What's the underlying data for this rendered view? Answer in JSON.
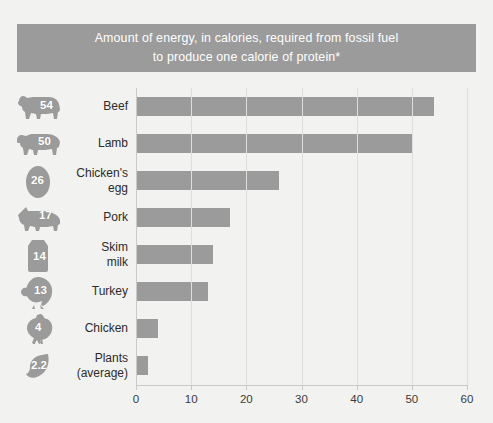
{
  "banner": {
    "line1": "Amount of energy, in calories, required from fossil fuel",
    "line2": "to produce one calorie of protein*"
  },
  "colors": {
    "banner_bg": "#9b9b9b",
    "banner_text": "#ffffff",
    "bar": "#9b9b9b",
    "icon": "#9b9b9b",
    "page_bg": "#f2f2f0",
    "axis": "#c9c9c7",
    "gridline": "#dededc",
    "label_text": "#2b2b2b"
  },
  "chart_data": {
    "type": "bar",
    "orientation": "horizontal",
    "title": "Amount of energy, in calories, required from fossil fuel to produce one calorie of protein*",
    "xlabel": "",
    "ylabel": "",
    "xlim": [
      0,
      60
    ],
    "xticks": [
      0,
      10,
      20,
      30,
      40,
      50,
      60
    ],
    "xtick_labels": [
      "0",
      "10",
      "20",
      "30",
      "40",
      "50",
      "60"
    ],
    "grid": true,
    "legend": false,
    "categories": [
      "Beef",
      "Lamb",
      "Chicken's egg",
      "Pork",
      "Skim milk",
      "Turkey",
      "Chicken",
      "Plants (average)"
    ],
    "values": [
      54,
      50,
      26,
      17,
      14,
      13,
      4,
      2.2
    ]
  },
  "rows": [
    {
      "label_line1": "Beef",
      "label_line2": "",
      "value": 54,
      "value_label": "54",
      "icon": "cow-icon",
      "value_x": 26,
      "value_y": 11
    },
    {
      "label_line1": "Lamb",
      "label_line2": "",
      "value": 50,
      "value_label": "50",
      "icon": "lamb-icon",
      "value_x": 24,
      "value_y": 10
    },
    {
      "label_line1": "Chicken's",
      "label_line2": "egg",
      "value": 26,
      "value_label": "26",
      "icon": "egg-icon",
      "value_x": 17,
      "value_y": 12
    },
    {
      "label_line1": "Pork",
      "label_line2": "",
      "value": 17,
      "value_label": "17",
      "icon": "pig-icon",
      "value_x": 25,
      "value_y": 10
    },
    {
      "label_line1": "Skim",
      "label_line2": "milk",
      "value": 14,
      "value_label": "14",
      "icon": "milk-carton-icon",
      "value_x": 19,
      "value_y": 14
    },
    {
      "label_line1": "Turkey",
      "label_line2": "",
      "value": 13,
      "value_label": "13",
      "icon": "turkey-icon",
      "value_x": 20,
      "value_y": 11
    },
    {
      "label_line1": "Chicken",
      "label_line2": "",
      "value": 4,
      "value_label": "4",
      "icon": "chicken-icon",
      "value_x": 21,
      "value_y": 11
    },
    {
      "label_line1": "Plants",
      "label_line2": "(average)",
      "value": 2.2,
      "value_label": "2.2",
      "icon": "leaf-icon",
      "value_x": 17,
      "value_y": 12
    }
  ]
}
